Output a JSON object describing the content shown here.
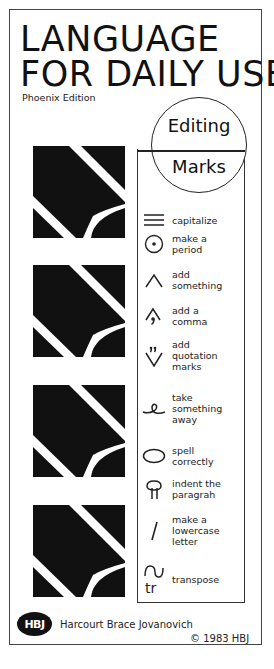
{
  "cover": {
    "title_lines": [
      "LANGUAGE",
      "FOR DAILY USE"
    ],
    "edition": "Phoenix Edition"
  },
  "badge": {
    "top_word": "Editing",
    "bottom_word": "Marks"
  },
  "editing_marks": [
    {
      "icon": "three-lines-icon",
      "label_lines": [
        "capitalize"
      ]
    },
    {
      "icon": "circled-dot-icon",
      "label_lines": [
        "make a",
        "period"
      ]
    },
    {
      "icon": "caret-icon",
      "label_lines": [
        "add",
        "something"
      ]
    },
    {
      "icon": "caret-comma-icon",
      "label_lines": [
        "add a",
        "comma"
      ]
    },
    {
      "icon": "inverted-caret-quotes-icon",
      "label_lines": [
        "add",
        "quotation",
        "marks"
      ]
    },
    {
      "icon": "delete-loop-icon",
      "label_lines": [
        "take",
        "something",
        "away"
      ]
    },
    {
      "icon": "oval-icon",
      "label_lines": [
        "spell",
        "correctly"
      ]
    },
    {
      "icon": "paragraph-icon",
      "label_lines": [
        "indent the",
        "paragrah"
      ]
    },
    {
      "icon": "slash-icon",
      "label_lines": [
        "make a",
        "lowercase",
        "letter"
      ]
    },
    {
      "icon": "transpose-icon",
      "label_lines": [
        "transpose"
      ]
    }
  ],
  "publisher": {
    "logo_text": "HBJ",
    "name": "Harcourt Brace Jovanovich",
    "copyright": "© 1983 HBJ"
  },
  "colors": {
    "ink": "#111111",
    "paper": "#ffffff",
    "border": "#444444"
  }
}
